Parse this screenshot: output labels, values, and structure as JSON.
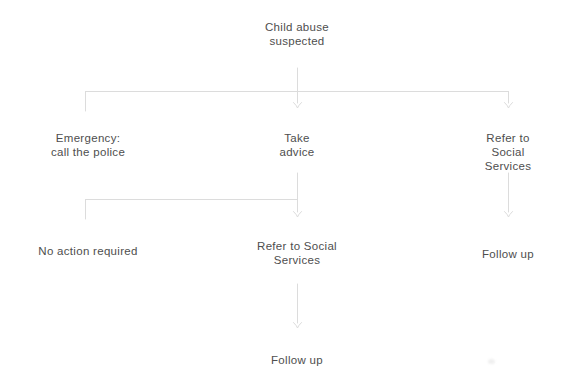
{
  "canvas": {
    "width": 580,
    "height": 384,
    "background": "#ffffff"
  },
  "colors": {
    "connector": "#dcdcdc",
    "text": "#4e4e4e"
  },
  "flowchart": {
    "title": "Child abuse suspected decision flowchart",
    "nodes": {
      "root": {
        "label": "Child abuse\nsuspected"
      },
      "emergency": {
        "label": "Emergency:\ncall the police"
      },
      "take_advice": {
        "label": "Take\nadvice"
      },
      "refer_social_right": {
        "label": "Refer to Social\nServices"
      },
      "no_action": {
        "label": "No action required"
      },
      "refer_social_mid": {
        "label": "Refer to Social\nServices"
      },
      "follow_up_right": {
        "label": "Follow up"
      },
      "follow_up_bottom": {
        "label": "Follow up"
      }
    },
    "edges": [
      {
        "from": "root",
        "to": "emergency"
      },
      {
        "from": "root",
        "to": "take_advice"
      },
      {
        "from": "root",
        "to": "refer_social_right"
      },
      {
        "from": "take_advice",
        "to": "no_action"
      },
      {
        "from": "take_advice",
        "to": "refer_social_mid"
      },
      {
        "from": "refer_social_right",
        "to": "follow_up_right"
      },
      {
        "from": "refer_social_mid",
        "to": "follow_up_bottom"
      }
    ]
  }
}
